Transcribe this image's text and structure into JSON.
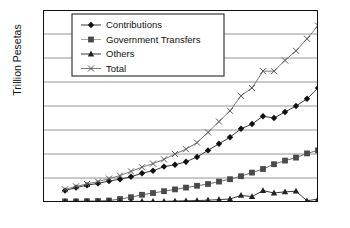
{
  "chart_data": {
    "type": "line",
    "title": "",
    "xlabel": "",
    "ylabel": "Trillion Pesetas",
    "xlim": [
      1975,
      2000
    ],
    "ylim": [
      0,
      16
    ],
    "xticks": [
      1975,
      1980,
      1985,
      1990,
      1995,
      2000
    ],
    "yticks": [
      0,
      2,
      4,
      6,
      8,
      10,
      12,
      14,
      16
    ],
    "grid": "horizontal",
    "legend_position": "top-left-inside",
    "x": [
      1977,
      1978,
      1979,
      1980,
      1981,
      1982,
      1983,
      1984,
      1985,
      1986,
      1987,
      1988,
      1989,
      1990,
      1991,
      1992,
      1993,
      1994,
      1995,
      1996,
      1997,
      1998,
      1999,
      2000
    ],
    "series": [
      {
        "name": "Contributions",
        "marker": "diamond",
        "values": [
          0.95,
          1.2,
          1.4,
          1.55,
          1.75,
          1.9,
          2.1,
          2.4,
          2.6,
          2.95,
          3.1,
          3.35,
          3.75,
          4.3,
          4.85,
          5.4,
          6.1,
          6.5,
          7.15,
          7.0,
          7.5,
          8.0,
          8.6,
          9.5
        ]
      },
      {
        "name": "Government Transfers",
        "marker": "square",
        "values": [
          0.05,
          0.05,
          0.07,
          0.08,
          0.12,
          0.25,
          0.4,
          0.6,
          0.75,
          0.9,
          1.05,
          1.2,
          1.35,
          1.5,
          1.7,
          1.9,
          2.15,
          2.45,
          2.75,
          3.15,
          3.45,
          3.7,
          4.05,
          4.3
        ]
      },
      {
        "name": "Others",
        "marker": "triangle",
        "values": [
          0.05,
          0.05,
          0.05,
          0.05,
          0.05,
          0.05,
          0.05,
          0.05,
          0.05,
          0.05,
          0.08,
          0.1,
          0.12,
          0.15,
          0.2,
          0.25,
          0.55,
          0.45,
          0.95,
          0.75,
          0.85,
          0.9,
          0.1,
          0.25
        ]
      },
      {
        "name": "Total",
        "marker": "cross",
        "values": [
          1.05,
          1.3,
          1.5,
          1.7,
          1.95,
          2.2,
          2.55,
          2.9,
          3.2,
          3.55,
          4.0,
          4.4,
          4.95,
          5.8,
          6.7,
          7.6,
          8.85,
          9.5,
          10.9,
          10.9,
          11.8,
          12.6,
          13.6,
          14.7
        ]
      }
    ],
    "legend": [
      {
        "label": "Contributions",
        "marker": "diamond"
      },
      {
        "label": "Government Transfers",
        "marker": "square"
      },
      {
        "label": "Others",
        "marker": "triangle"
      },
      {
        "label": "Total",
        "marker": "cross"
      }
    ]
  }
}
